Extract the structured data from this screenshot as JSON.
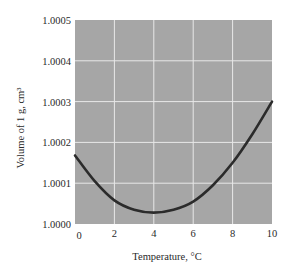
{
  "chart_data": {
    "type": "line",
    "title": "",
    "xlabel": "Temperature, °C",
    "ylabel": "Volume of 1 g, cm³",
    "xlim": [
      0,
      10
    ],
    "ylim": [
      1.0,
      1.0005
    ],
    "x_ticks": [
      "0",
      "2",
      "4",
      "6",
      "8",
      "10"
    ],
    "y_ticks": [
      "1.0000",
      "1.0001",
      "1.0002",
      "1.0003",
      "1.0004",
      "1.0005"
    ],
    "grid": true,
    "legend": null,
    "series": [
      {
        "name": "Volume of 1 g of water",
        "x": [
          0,
          1,
          2,
          3,
          4,
          5,
          6,
          7,
          8,
          9,
          10
        ],
        "values": [
          1.000168,
          1.000105,
          1.000058,
          1.000035,
          1.000028,
          1.000035,
          1.000055,
          1.000095,
          1.00015,
          1.00022,
          1.0003
        ]
      }
    ]
  },
  "colors": {
    "plot_background": "#a6a6a6",
    "grid": "#e8e8e8",
    "curve": "#2b2b2b"
  }
}
